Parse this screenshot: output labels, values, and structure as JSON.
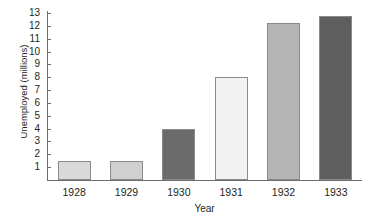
{
  "chart_data": {
    "type": "bar",
    "title": "",
    "xlabel": "Year",
    "ylabel": "Unemployed (millions)",
    "categories": [
      "1928",
      "1929",
      "1930",
      "1931",
      "1932",
      "1933"
    ],
    "values": [
      1.5,
      1.5,
      4.0,
      8.0,
      12.2,
      12.8
    ],
    "ylim": [
      0,
      13
    ],
    "ytick_labels": [
      "1",
      "2",
      "3",
      "4",
      "5",
      "6",
      "7",
      "8",
      "9",
      "10",
      "11",
      "12",
      "13"
    ],
    "ytick_values": [
      1,
      2,
      3,
      4,
      5,
      6,
      7,
      8,
      9,
      10,
      11,
      12,
      13
    ],
    "grid": false,
    "legend": false,
    "bar_colors": [
      "#d9d9d9",
      "#d0d0d0",
      "#6b6b6b",
      "#f2f2f2",
      "#b5b5b5",
      "#5e5e5e"
    ],
    "bar_border_color": "#8a8a8a",
    "axis_color": "#6e6e6e",
    "background_color": "#ffffff"
  }
}
